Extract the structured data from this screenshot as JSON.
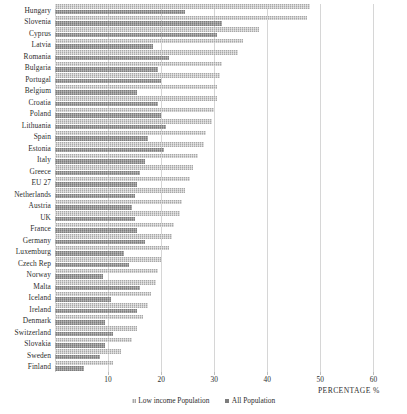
{
  "chart_data": {
    "type": "bar",
    "orientation": "horizontal",
    "title": "",
    "xlabel": "PERCENTAGE %",
    "ylabel": "",
    "xlim": [
      0,
      62
    ],
    "xticks": [
      10,
      20,
      30,
      40,
      50,
      60
    ],
    "grid": true,
    "legend_position": "bottom",
    "categories": [
      "Hungary",
      "Slovenia",
      "Cyprus",
      "Latvia",
      "Romania",
      "Bulgaria",
      "Portugal",
      "Belgium",
      "Croatia",
      "Poland",
      "Lithuania",
      "Spain",
      "Estonia",
      "Italy",
      "Greece",
      "EU 27",
      "Netherlands",
      "Austria",
      "UK",
      "France",
      "Germany",
      "Luxemburg",
      "Czech Rep",
      "Norway",
      "Malta",
      "Iceland",
      "Ireland",
      "Denmark",
      "Switzerland",
      "Slovakia",
      "Sweden",
      "Finland"
    ],
    "series": [
      {
        "name": "Low income Population",
        "color": "#a8a8a8",
        "values": [
          48.0,
          47.5,
          38.5,
          35.5,
          34.5,
          31.5,
          31.0,
          30.5,
          30.5,
          30.0,
          29.5,
          28.5,
          28.0,
          27.0,
          26.0,
          25.5,
          24.5,
          24.0,
          23.5,
          22.5,
          22.0,
          21.5,
          20.0,
          19.5,
          19.0,
          18.0,
          17.5,
          16.5,
          15.5,
          14.5,
          12.5,
          11.0
        ]
      },
      {
        "name": "All Population",
        "color": "#7d7d7d",
        "values": [
          24.5,
          31.5,
          30.5,
          18.5,
          21.5,
          19.5,
          20.0,
          15.5,
          19.5,
          20.0,
          21.0,
          17.5,
          20.5,
          17.0,
          16.0,
          15.5,
          15.0,
          14.5,
          15.0,
          15.5,
          17.0,
          13.0,
          14.0,
          9.0,
          16.0,
          10.5,
          15.5,
          9.5,
          11.0,
          9.5,
          8.5,
          5.5
        ]
      }
    ]
  },
  "legend": {
    "items": [
      {
        "label": "Low income Population"
      },
      {
        "label": "All Population"
      }
    ]
  },
  "axis": {
    "x_title": "PERCENTAGE %"
  }
}
